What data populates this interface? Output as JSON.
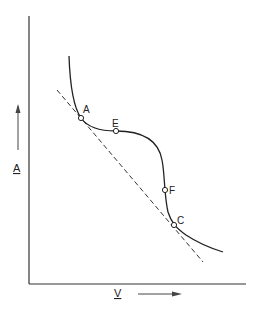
{
  "diagram": {
    "type": "free-energy-vs-volume curve with common tangent",
    "axes": {
      "y_label": "A",
      "x_label": "V",
      "y_arrow": "up",
      "x_arrow": "right"
    },
    "points": [
      {
        "label": "A",
        "x": 81,
        "y": 118
      },
      {
        "label": "E",
        "x": 116,
        "y": 131
      },
      {
        "label": "F",
        "x": 165,
        "y": 190
      },
      {
        "label": "C",
        "x": 174,
        "y": 225
      }
    ],
    "curve": "solid",
    "tangent_line": "dashed, touching curve at A and C",
    "colors": {
      "ink": "#222222",
      "background": "#ffffff"
    }
  }
}
